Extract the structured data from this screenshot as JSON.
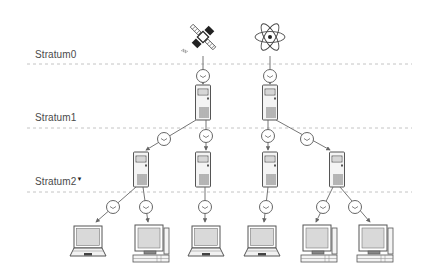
{
  "diagram": {
    "strata": [
      {
        "label": "Stratum0",
        "marker": ""
      },
      {
        "label": "Stratum1",
        "marker": ""
      },
      {
        "label": "Stratum2",
        "marker": "▼"
      }
    ],
    "sources": [
      {
        "type": "satellite-icon",
        "name": "GPS satellite"
      },
      {
        "type": "atom-icon",
        "name": "Atomic clock"
      }
    ],
    "stratum1_servers": 2,
    "stratum2_servers": 4,
    "clients": [
      {
        "type": "laptop"
      },
      {
        "type": "desktop"
      },
      {
        "type": "laptop"
      },
      {
        "type": "laptop"
      },
      {
        "type": "desktop"
      },
      {
        "type": "desktop"
      }
    ],
    "connector_icon": "clock-icon",
    "colors": {
      "line": "#777777",
      "dashed": "#b0b0b0",
      "screen": "#d8d8d8",
      "outline": "#555555"
    }
  }
}
